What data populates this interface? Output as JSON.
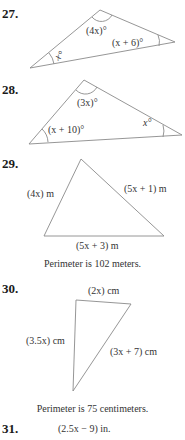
{
  "problems": [
    {
      "number": "27.",
      "labels": {
        "top": "(4x)°",
        "right": "(x + 6)°",
        "left": "x°"
      }
    },
    {
      "number": "28.",
      "labels": {
        "top": "(3x)°",
        "left": "(x + 10)°",
        "right": "x°"
      }
    },
    {
      "number": "29.",
      "labels": {
        "left": "(4x) m",
        "right": "(5x + 1) m",
        "bottom": "(5x + 3) m"
      },
      "caption": "Perimeter is 102 meters."
    },
    {
      "number": "30.",
      "labels": {
        "top": "(2x) cm",
        "left": "(3.5x) cm",
        "right": "(3x + 7) cm"
      },
      "caption": "Perimeter is 75 centimeters."
    },
    {
      "number": "31.",
      "labels": {
        "top": "(2.5x − 9) in."
      }
    }
  ],
  "colors": {
    "line": "#8a8a8a",
    "text": "#333333"
  }
}
